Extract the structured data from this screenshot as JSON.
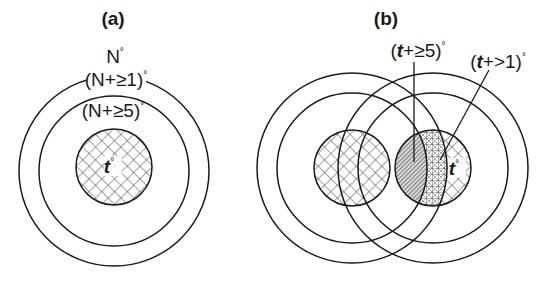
{
  "panels": [
    {
      "label": "(a)",
      "labels": {
        "outer": "N",
        "ring1": "(N+≥1)",
        "ring2": "(N+≥5)",
        "center": "t",
        "degree": "°"
      }
    },
    {
      "label": "(b)",
      "labels": {
        "callout_strong": "(t+≥5)",
        "callout_strong_var": "t",
        "callout_strong_rest": "+≥5)",
        "callout_weak": "(t+>1)",
        "callout_weak_var": "t",
        "callout_weak_rest": "+>1)",
        "open_paren": "(",
        "center": "t",
        "degree": "°"
      }
    }
  ],
  "colors": {
    "stroke": "#1a1a1a",
    "background": "#ffffff"
  }
}
